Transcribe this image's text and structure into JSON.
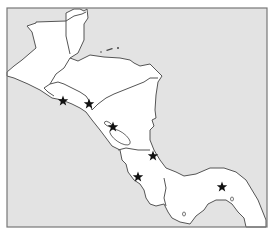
{
  "map": {
    "region": "Central America",
    "colors": {
      "sea": "#e3e3e3",
      "land": "#ffffff",
      "outline": "#555555",
      "marker": "#111111"
    },
    "markers": [
      {
        "id": "capital-1",
        "symbol": "star",
        "x": 63,
        "y": 101
      },
      {
        "id": "capital-2",
        "symbol": "star",
        "x": 89,
        "y": 104
      },
      {
        "id": "capital-3",
        "symbol": "star",
        "x": 113,
        "y": 127
      },
      {
        "id": "capital-4",
        "symbol": "star",
        "x": 153,
        "y": 156
      },
      {
        "id": "capital-5",
        "symbol": "star",
        "x": 138,
        "y": 177
      },
      {
        "id": "capital-6",
        "symbol": "star",
        "x": 222,
        "y": 187
      }
    ]
  }
}
